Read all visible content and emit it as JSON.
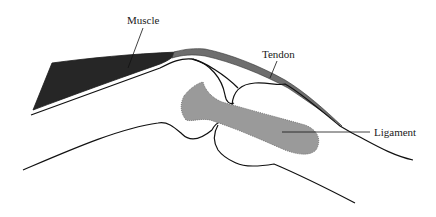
{
  "diagram": {
    "type": "anatomical-illustration",
    "labels": {
      "muscle": "Muscle",
      "tendon": "Tendon",
      "ligament": "Ligament"
    },
    "colors": {
      "muscle": "#262626",
      "tendon": "#6e6e6e",
      "ligament": "#9a9a9a",
      "outline": "#111111",
      "background": "#ffffff"
    }
  }
}
